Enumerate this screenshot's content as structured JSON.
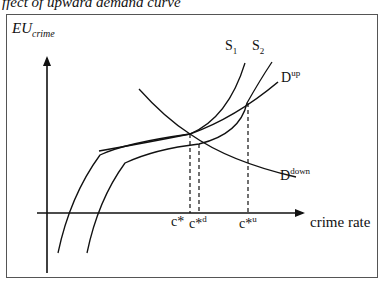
{
  "caption": "ffect of upward demand curve",
  "axes": {
    "y_label_main": "EU",
    "y_label_sub": "crime",
    "x_label": "crime rate"
  },
  "curves": {
    "s1": {
      "main": "S",
      "sub": "1"
    },
    "s2": {
      "main": "S",
      "sub": "2"
    },
    "d_up": {
      "main": "D",
      "sup": "up"
    },
    "d_down": {
      "main": "D",
      "sup": "down"
    }
  },
  "ticks": {
    "c_star": {
      "main": "c*",
      "sup": ""
    },
    "c_star_d": {
      "main": "c*",
      "sup": "d"
    },
    "c_star_u": {
      "main": "c*",
      "sup": "u"
    }
  },
  "colors": {
    "line": "#111111",
    "frame": "#555555",
    "background": "#ffffff"
  }
}
